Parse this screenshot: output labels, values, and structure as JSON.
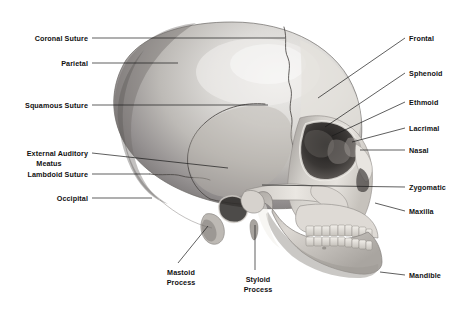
{
  "figure": {
    "style": "grayscale-pencil-illustration",
    "background_color": "#ffffff",
    "line_color": "#1a1a1a"
  },
  "labels": [
    {
      "id": "coronal-suture",
      "text": "Coronal Suture",
      "side": "left",
      "x": 20,
      "y": 34,
      "w": 68,
      "lines": 1
    },
    {
      "id": "parietal",
      "text": "Parietal",
      "side": "left",
      "x": 20,
      "y": 59,
      "w": 68,
      "lines": 1
    },
    {
      "id": "squamous-suture",
      "text": "Squamous Suture",
      "side": "left",
      "x": 14,
      "y": 101,
      "w": 74,
      "lines": 1
    },
    {
      "id": "external-auditory-meatus",
      "text": "External Auditory",
      "text2": "Meatus",
      "side": "left",
      "x": 10,
      "y": 149,
      "w": 78,
      "lines": 2
    },
    {
      "id": "lambdoid-suture",
      "text": "Lambdoid Suture",
      "side": "left",
      "x": 14,
      "y": 170,
      "w": 74,
      "lines": 1
    },
    {
      "id": "occipital",
      "text": "Occipital",
      "side": "left",
      "x": 20,
      "y": 194,
      "w": 68,
      "lines": 1
    },
    {
      "id": "mastoid-process",
      "text": "Mastoid",
      "text2": "Process",
      "side": "bottom",
      "x": 155,
      "y": 268,
      "w": 52,
      "lines": 2
    },
    {
      "id": "styloid-process",
      "text": "Styloid",
      "text2": "Process",
      "side": "bottom",
      "x": 234,
      "y": 275,
      "w": 48,
      "lines": 2
    },
    {
      "id": "frontal",
      "text": "Frontal",
      "side": "right",
      "x": 409,
      "y": 34,
      "w": 58,
      "lines": 1
    },
    {
      "id": "sphenoid",
      "text": "Sphenoid",
      "side": "right",
      "x": 409,
      "y": 69,
      "w": 58,
      "lines": 1
    },
    {
      "id": "ethmoid",
      "text": "Ethmoid",
      "side": "right",
      "x": 409,
      "y": 98,
      "w": 58,
      "lines": 1
    },
    {
      "id": "lacrimal",
      "text": "Lacrimal",
      "side": "right",
      "x": 409,
      "y": 124,
      "w": 58,
      "lines": 1
    },
    {
      "id": "nasal",
      "text": "Nasal",
      "side": "right",
      "x": 409,
      "y": 146,
      "w": 58,
      "lines": 1
    },
    {
      "id": "zygomatic",
      "text": "Zygomatic",
      "side": "right",
      "x": 409,
      "y": 183,
      "w": 58,
      "lines": 1
    },
    {
      "id": "maxilla",
      "text": "Maxilla",
      "side": "right",
      "x": 409,
      "y": 207,
      "w": 58,
      "lines": 1
    },
    {
      "id": "mandible",
      "text": "Mandible",
      "side": "right",
      "x": 409,
      "y": 271,
      "w": 58,
      "lines": 1
    }
  ],
  "leaders": [
    {
      "id": "leader-coronal-suture",
      "d": "M92,38 L285,38"
    },
    {
      "id": "leader-parietal",
      "d": "M92,63 L178,63"
    },
    {
      "id": "leader-squamous-suture",
      "d": "M92,105 L268,105"
    },
    {
      "id": "leader-external-auditory-meatus",
      "d": "M92,153 L228,168"
    },
    {
      "id": "leader-lambdoid-suture",
      "d": "M92,174 L150,174"
    },
    {
      "id": "leader-occipital",
      "d": "M92,198 L152,198"
    },
    {
      "id": "leader-mastoid-process",
      "d": "M178,263 L208,226"
    },
    {
      "id": "leader-styloid-process",
      "d": "M255,270 L255,225"
    },
    {
      "id": "leader-frontal",
      "d": "M405,38 L318,98"
    },
    {
      "id": "leader-sphenoid",
      "d": "M405,73 L325,127"
    },
    {
      "id": "leader-ethmoid",
      "d": "M405,102 L332,136"
    },
    {
      "id": "leader-lacrimal",
      "d": "M405,128 L352,142"
    },
    {
      "id": "leader-nasal",
      "d": "M405,150 L360,150"
    },
    {
      "id": "leader-zygomatic",
      "d": "M405,187 L262,185"
    },
    {
      "id": "leader-maxilla",
      "d": "M405,211 L375,203"
    },
    {
      "id": "leader-mandible",
      "d": "M405,275 L380,272"
    }
  ]
}
